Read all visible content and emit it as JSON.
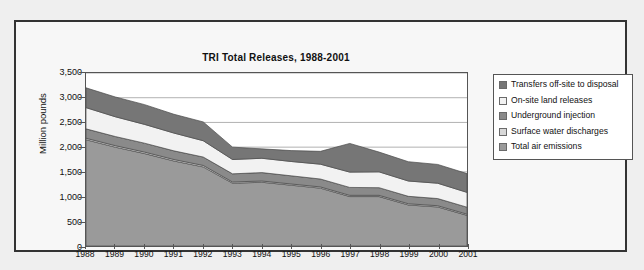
{
  "chart_data": {
    "type": "area",
    "title": "TRI Total Releases, 1988-2001",
    "xlabel": "",
    "ylabel": "Million pounds",
    "ylim": [
      0,
      3500
    ],
    "ytick_step": 500,
    "grid": true,
    "stacked": true,
    "legend_position": "right",
    "categories": [
      "1988",
      "1989",
      "1990",
      "1991",
      "1992",
      "1993",
      "1994",
      "1995",
      "1996",
      "1997",
      "1998",
      "1999",
      "2000",
      "2001"
    ],
    "yticks": [
      "0",
      "500",
      "1,000",
      "1,500",
      "2,000",
      "2,500",
      "3,000",
      "3,500"
    ],
    "series": [
      {
        "name": "Total air emissions",
        "color": "#9a9a9a",
        "values": [
          2150,
          2000,
          1870,
          1720,
          1600,
          1270,
          1290,
          1230,
          1170,
          1000,
          1000,
          830,
          790,
          620
        ]
      },
      {
        "name": "Surface water discharges",
        "color": "#d8d8d8",
        "values": [
          30,
          30,
          30,
          30,
          30,
          25,
          25,
          25,
          25,
          25,
          25,
          25,
          25,
          25
        ]
      },
      {
        "name": "Underground injection",
        "color": "#8a8a8a",
        "values": [
          190,
          185,
          180,
          175,
          170,
          165,
          170,
          165,
          160,
          160,
          155,
          150,
          145,
          140
        ]
      },
      {
        "name": "On-site land releases",
        "color": "#f2f2f2",
        "values": [
          430,
          400,
          380,
          360,
          330,
          290,
          290,
          290,
          300,
          310,
          320,
          310,
          310,
          300
        ]
      },
      {
        "name": "Transfers off-site to disposal",
        "color": "#767676",
        "values": [
          400,
          400,
          400,
          380,
          380,
          250,
          190,
          220,
          260,
          580,
          400,
          390,
          380,
          380
        ]
      }
    ]
  },
  "legend": {
    "entries": [
      {
        "label": "Transfers off-site to disposal",
        "color": "#767676"
      },
      {
        "label": "On-site land releases",
        "color": "#f2f2f2"
      },
      {
        "label": "Underground injection",
        "color": "#8a8a8a"
      },
      {
        "label": "Surface water discharges",
        "color": "#d8d8d8"
      },
      {
        "label": "Total air emissions",
        "color": "#9a9a9a"
      }
    ]
  }
}
